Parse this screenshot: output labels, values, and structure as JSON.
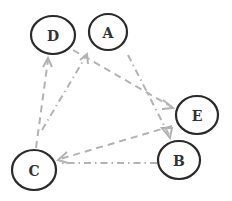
{
  "diagram": {
    "type": "directed-graph",
    "edge_color": "#b3b3b3",
    "node_stroke_color": "#2a2a2a",
    "nodes": [
      {
        "id": "D",
        "label": "D",
        "cx": 53,
        "cy": 35,
        "rx": 23,
        "ry": 20
      },
      {
        "id": "A",
        "label": "A",
        "cx": 108,
        "cy": 32,
        "rx": 20,
        "ry": 19
      },
      {
        "id": "E",
        "label": "E",
        "cx": 197,
        "cy": 115,
        "rx": 21,
        "ry": 19
      },
      {
        "id": "B",
        "label": "B",
        "cx": 179,
        "cy": 160,
        "rx": 21,
        "ry": 19
      },
      {
        "id": "C",
        "label": "C",
        "cx": 34,
        "cy": 170,
        "rx": 22,
        "ry": 20
      }
    ],
    "edges": [
      {
        "from": "C",
        "to": "D",
        "style": "dashed"
      },
      {
        "from": "C",
        "to": "A",
        "style": "dash-dot"
      },
      {
        "from": "D",
        "to": "E",
        "style": "dashed"
      },
      {
        "from": "A",
        "to": "B",
        "style": "dash-dot"
      },
      {
        "from": "E",
        "to": "C",
        "style": "dashed"
      },
      {
        "from": "B",
        "to": "C",
        "style": "dash-dot"
      }
    ]
  }
}
